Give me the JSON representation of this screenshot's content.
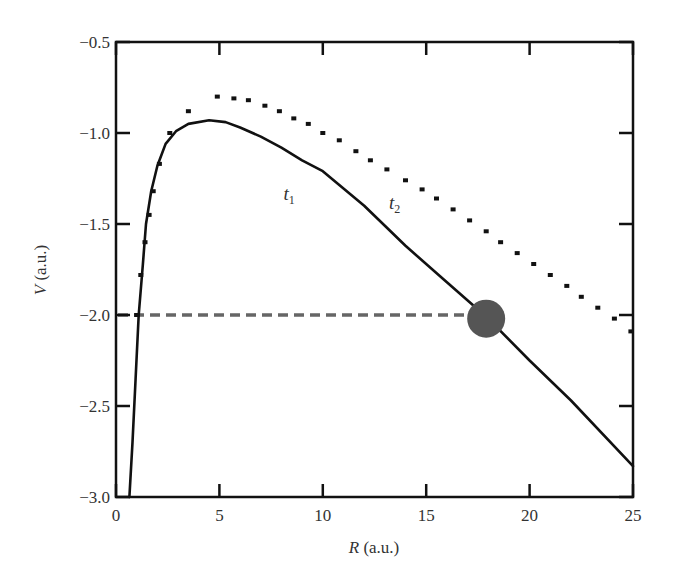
{
  "chart_data": {
    "type": "line",
    "title": "",
    "xlabel": "R (a.u.)",
    "xlabel_italic_part": "R",
    "xlabel_unit": " (a.u.)",
    "ylabel": "V (a.u.)",
    "ylabel_italic_part": "V",
    "ylabel_unit": " (a.u.)",
    "xlim": [
      0,
      25
    ],
    "ylim": [
      -3.0,
      -0.5
    ],
    "xticks": [
      0,
      5,
      10,
      15,
      20,
      25
    ],
    "xtick_labels": [
      "0",
      "5",
      "10",
      "15",
      "20",
      "25"
    ],
    "yticks": [
      -0.5,
      -1.0,
      -1.5,
      -2.0,
      -2.5,
      -3.0
    ],
    "ytick_labels": [
      "−0.5",
      "−1.0",
      "−1.5",
      "−2.0",
      "−2.5",
      "−3.0"
    ],
    "grid": false,
    "legend": "none",
    "series": [
      {
        "name": "t1",
        "label_text": "t",
        "label_sub": "1",
        "label_pos": [
          8.1,
          -1.37
        ],
        "style": "solid",
        "color": "#111111",
        "x": [
          0.65,
          0.8,
          0.95,
          1.1,
          1.3,
          1.45,
          1.7,
          2.0,
          2.4,
          2.9,
          3.5,
          4.5,
          5.3,
          6.0,
          7.0,
          8.0,
          9.0,
          10.0,
          12.0,
          14.0,
          16.0,
          18.0,
          20.0,
          22.0,
          25.0
        ],
        "y": [
          -3.0,
          -2.7,
          -2.35,
          -2.0,
          -1.72,
          -1.5,
          -1.32,
          -1.18,
          -1.06,
          -0.99,
          -0.95,
          -0.93,
          -0.94,
          -0.97,
          -1.02,
          -1.08,
          -1.15,
          -1.21,
          -1.4,
          -1.62,
          -1.82,
          -2.02,
          -2.25,
          -2.47,
          -2.83
        ]
      },
      {
        "name": "t2",
        "label_text": "t",
        "label_sub": "2",
        "label_pos": [
          13.2,
          -1.42
        ],
        "style": "dotted",
        "color": "#111111",
        "x": [
          1.0,
          1.2,
          1.4,
          1.6,
          1.8,
          2.1,
          2.6,
          3.5,
          4.9,
          5.7,
          6.4,
          7.2,
          7.9,
          8.6,
          9.3,
          10.0,
          10.8,
          11.6,
          12.3,
          13.1,
          14.0,
          14.8,
          15.5,
          16.3,
          17.1,
          17.9,
          18.6,
          19.4,
          20.2,
          21.0,
          21.8,
          22.5,
          23.3,
          24.1,
          24.9
        ],
        "y": [
          -2.0,
          -1.78,
          -1.6,
          -1.45,
          -1.32,
          -1.17,
          -1.0,
          -0.88,
          -0.8,
          -0.81,
          -0.82,
          -0.85,
          -0.88,
          -0.92,
          -0.95,
          -1.0,
          -1.04,
          -1.1,
          -1.15,
          -1.2,
          -1.26,
          -1.31,
          -1.36,
          -1.42,
          -1.48,
          -1.54,
          -1.6,
          -1.66,
          -1.72,
          -1.78,
          -1.84,
          -1.9,
          -1.96,
          -2.02,
          -2.09
        ]
      }
    ],
    "annotations": [
      {
        "type": "hline-dashed",
        "y": -2.0,
        "x_from": 0.0,
        "x_to": 17.6,
        "color": "#666666"
      },
      {
        "type": "circle-marker",
        "x": 17.9,
        "y": -2.02,
        "radius_px": 19,
        "color": "#555555"
      }
    ]
  }
}
